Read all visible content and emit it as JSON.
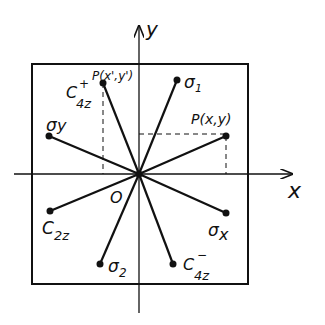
{
  "axes": {
    "x_label": "x",
    "y_label": "y",
    "origin_label": "O"
  },
  "points": {
    "p_prime": {
      "label": "P(x',y')"
    },
    "p": {
      "label": "P(x,y)"
    }
  },
  "operations": {
    "c4z_plus": {
      "main": "C",
      "sub": "4z",
      "sup": "+"
    },
    "sigma1": {
      "main": "σ",
      "sub": "1"
    },
    "sigma_y": {
      "main": "σ",
      "sub": "y"
    },
    "c2z": {
      "main": "C",
      "sub": "2z"
    },
    "sigma_x": {
      "main": "σ",
      "sub": "x"
    },
    "sigma2": {
      "main": "σ",
      "sub": "2"
    },
    "c4z_minus": {
      "main": "C",
      "sub": "4z",
      "sup": "−"
    }
  }
}
